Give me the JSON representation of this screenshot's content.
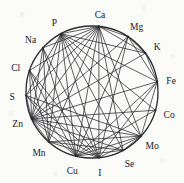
{
  "figure": {
    "type": "circular-network-diagram",
    "title": "",
    "background_color": "#fbfbfa",
    "line_color": "#2a2a2e",
    "text_color": "#17171a",
    "circle": {
      "cx": 92,
      "cy": 92,
      "r": 66,
      "stroke_width": 1.3
    }
  },
  "chart_data": {
    "type": "network",
    "layout": "circular",
    "title": "",
    "xlabel": "",
    "ylabel": "",
    "grid": false,
    "legend": "none",
    "node_count": 15,
    "nodes": [
      {
        "id": "Ca",
        "label": "Ca",
        "angle_deg": -84,
        "label_dx": 0,
        "label_dy": -4
      },
      {
        "id": "Mg",
        "label": "Mg",
        "angle_deg": -57,
        "label_dx": 7,
        "label_dy": -3
      },
      {
        "id": "K",
        "label": "K",
        "angle_deg": -36,
        "label_dx": 8,
        "label_dy": 0
      },
      {
        "id": "Fe",
        "label": "Fe",
        "angle_deg": -9,
        "label_dx": 9,
        "label_dy": 2
      },
      {
        "id": "Co",
        "label": "Co",
        "angle_deg": 16,
        "label_dx": 9,
        "label_dy": 4
      },
      {
        "id": "Mo",
        "label": "Mo",
        "angle_deg": 42,
        "label_dx": 8,
        "label_dy": 6
      },
      {
        "id": "Se",
        "label": "Se",
        "angle_deg": 62,
        "label_dx": 4,
        "label_dy": 10
      },
      {
        "id": "I",
        "label": "I",
        "angle_deg": 84,
        "label_dx": 0,
        "label_dy": 11
      },
      {
        "id": "Cu",
        "label": "Cu",
        "angle_deg": 104,
        "label_dx": -3,
        "label_dy": 11
      },
      {
        "id": "Mn",
        "label": "Mn",
        "angle_deg": 131,
        "label_dx": -7,
        "label_dy": 9
      },
      {
        "id": "Zn",
        "label": "Zn",
        "angle_deg": 156,
        "label_dx": -11,
        "label_dy": 3
      },
      {
        "id": "S",
        "label": "S",
        "angle_deg": 177,
        "label_dx": -9,
        "label_dy": 3
      },
      {
        "id": "Cl",
        "label": "Cl",
        "angle_deg": 199,
        "label_dx": -10,
        "label_dy": 1
      },
      {
        "id": "Na",
        "label": "Na",
        "angle_deg": 222,
        "label_dx": -11,
        "label_dy": -2
      },
      {
        "id": "P",
        "label": "P",
        "angle_deg": -118,
        "label_dx": -4,
        "label_dy": -4
      }
    ],
    "edges": [
      [
        "Ca",
        "Zn"
      ],
      [
        "Ca",
        "Mn"
      ],
      [
        "Ca",
        "Cu"
      ],
      [
        "Ca",
        "I"
      ],
      [
        "Ca",
        "Se"
      ],
      [
        "Ca",
        "Mo"
      ],
      [
        "Ca",
        "P"
      ],
      [
        "Ca",
        "Mg"
      ],
      [
        "Ca",
        "Na"
      ],
      [
        "Ca",
        "S"
      ],
      [
        "Ca",
        "Cl"
      ],
      [
        "Ca",
        "K"
      ],
      [
        "P",
        "Zn"
      ],
      [
        "P",
        "Mn"
      ],
      [
        "P",
        "Cu"
      ],
      [
        "P",
        "I"
      ],
      [
        "P",
        "Mo"
      ],
      [
        "P",
        "Fe"
      ],
      [
        "P",
        "K"
      ],
      [
        "P",
        "Co"
      ],
      [
        "P",
        "Se"
      ],
      [
        "P",
        "S"
      ],
      [
        "Zn",
        "Mg"
      ],
      [
        "Zn",
        "K"
      ],
      [
        "Zn",
        "Fe"
      ],
      [
        "Zn",
        "Co"
      ],
      [
        "Zn",
        "Mo"
      ],
      [
        "Zn",
        "Se"
      ],
      [
        "Zn",
        "I"
      ],
      [
        "Zn",
        "Cu"
      ],
      [
        "Zn",
        "Mn"
      ],
      [
        "Zn",
        "Na"
      ],
      [
        "Zn",
        "Cl"
      ],
      [
        "Zn",
        "S"
      ],
      [
        "Na",
        "Cu"
      ],
      [
        "Na",
        "I"
      ],
      [
        "Na",
        "Mn"
      ],
      [
        "Cl",
        "Cu"
      ],
      [
        "Cl",
        "I"
      ],
      [
        "Cl",
        "Mn"
      ],
      [
        "S",
        "Cu"
      ],
      [
        "S",
        "I"
      ],
      [
        "S",
        "Mo"
      ],
      [
        "Mn",
        "Mo"
      ],
      [
        "Mn",
        "Se"
      ],
      [
        "Mn",
        "I"
      ],
      [
        "Cu",
        "Mg"
      ],
      [
        "Cu",
        "Fe"
      ],
      [
        "Cu",
        "Mo"
      ],
      [
        "Cu",
        "Se"
      ],
      [
        "I",
        "Mg"
      ],
      [
        "I",
        "Fe"
      ],
      [
        "I",
        "Mo"
      ],
      [
        "Mg",
        "Fe"
      ],
      [
        "Mg",
        "K"
      ],
      [
        "K",
        "Fe"
      ],
      [
        "Fe",
        "Mo"
      ],
      [
        "Co",
        "Cu"
      ],
      [
        "Se",
        "Mo"
      ]
    ]
  }
}
